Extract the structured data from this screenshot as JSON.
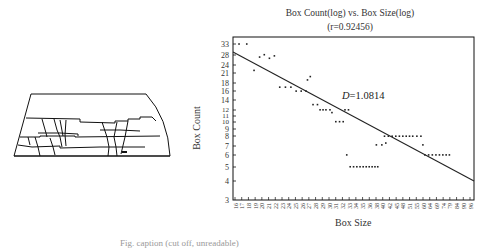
{
  "chart_data": {
    "type": "scatter",
    "title": "Box Count(log) vs. Box Size(log)",
    "subtitle": "(r=0.92456)",
    "r_value": 0.92456,
    "xlabel": "Box Size",
    "ylabel": "Box Count",
    "x_scale": "log",
    "y_scale": "log",
    "xlim": [
      16,
      96
    ],
    "ylim": [
      3,
      36
    ],
    "grid": false,
    "legend": null,
    "x_tick_labels": [
      "16",
      "17",
      "18",
      "19",
      "20",
      "21",
      "22",
      "23",
      "24",
      "25",
      "26",
      "27",
      "28",
      "29",
      "30",
      "31",
      "32",
      "33",
      "34",
      "35",
      "36",
      "38",
      "40",
      "42",
      "45",
      "48",
      "51",
      "55",
      "60",
      "64",
      "69",
      "74",
      "79",
      "84",
      "90",
      "96"
    ],
    "y_tick_labels": [
      "33",
      "28",
      "24",
      "21",
      "18",
      "16",
      "14",
      "12",
      "11",
      "10",
      "9",
      "8",
      "7",
      "6",
      "5",
      "4",
      "3"
    ],
    "annotation": {
      "label": "D",
      "value": "=1.0814"
    },
    "fit_line": {
      "slope_loglog": -1.0814,
      "start": {
        "x": 16,
        "y": 29.5
      },
      "end": {
        "x": 96,
        "y": 4.2
      }
    },
    "series": [
      {
        "name": "box counts",
        "points": [
          [
            16.5,
            33
          ],
          [
            17.5,
            33
          ],
          [
            18.5,
            22
          ],
          [
            19.3,
            27
          ],
          [
            20.0,
            28
          ],
          [
            20.8,
            26.5
          ],
          [
            21.6,
            27.5
          ],
          [
            22.5,
            17
          ],
          [
            23.5,
            17
          ],
          [
            24.5,
            17
          ],
          [
            25.5,
            16
          ],
          [
            26.5,
            16
          ],
          [
            27.5,
            16
          ],
          [
            27.8,
            19
          ],
          [
            28.4,
            20
          ],
          [
            29,
            13
          ],
          [
            30,
            13
          ],
          [
            30.6,
            12
          ],
          [
            31.3,
            12
          ],
          [
            32,
            12
          ],
          [
            33,
            12
          ],
          [
            33.5,
            11.5
          ],
          [
            34.5,
            10
          ],
          [
            35.5,
            10
          ],
          [
            36.5,
            10
          ],
          [
            37,
            12
          ],
          [
            38,
            12
          ],
          [
            37.5,
            6
          ],
          [
            38.5,
            5
          ],
          [
            39.5,
            5
          ],
          [
            40.5,
            5
          ],
          [
            41.5,
            5
          ],
          [
            42.5,
            5
          ],
          [
            43.5,
            5
          ],
          [
            44.5,
            5
          ],
          [
            45.5,
            5
          ],
          [
            46.5,
            5
          ],
          [
            47.5,
            5
          ],
          [
            47,
            7
          ],
          [
            49,
            7
          ],
          [
            50.5,
            7.2
          ],
          [
            50,
            8
          ],
          [
            51.5,
            8
          ],
          [
            53,
            8
          ],
          [
            54.5,
            8
          ],
          [
            56,
            8
          ],
          [
            57.5,
            8
          ],
          [
            59,
            8
          ],
          [
            60.5,
            8
          ],
          [
            62,
            8
          ],
          [
            64,
            8
          ],
          [
            66,
            8
          ],
          [
            67,
            7
          ],
          [
            68,
            6
          ],
          [
            70,
            6
          ],
          [
            72,
            6
          ],
          [
            74,
            6
          ],
          [
            76,
            6
          ],
          [
            78,
            6
          ],
          [
            80,
            6
          ],
          [
            82,
            6
          ]
        ]
      }
    ]
  },
  "left_figure": {
    "description": "line drawing of a layered cross-section with vertical cracks"
  },
  "caption": "Fig. caption (cut off, unreadable)"
}
